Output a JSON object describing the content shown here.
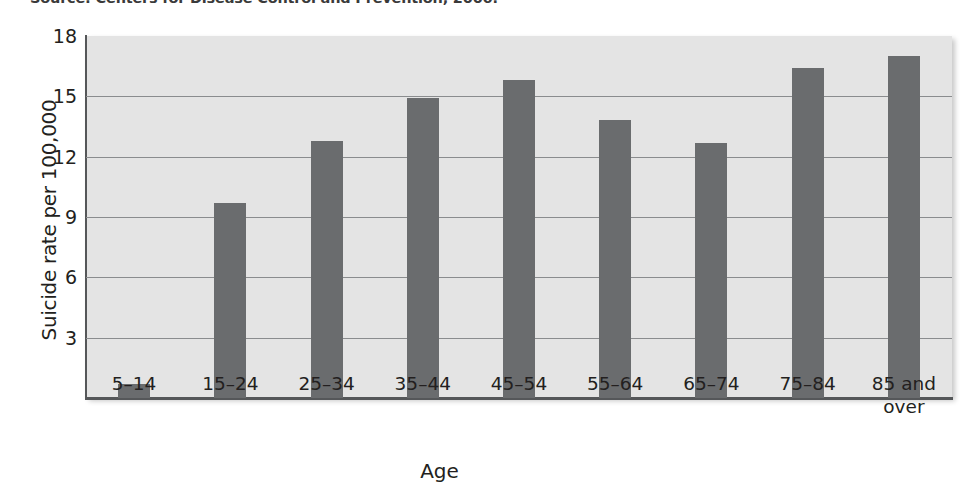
{
  "figure": {
    "source_note": "Source: Centers for Disease Control and Prevention, 2006."
  },
  "chart_data": {
    "type": "bar",
    "title": "",
    "subtitle": "",
    "xlabel": "Age",
    "ylabel": "Suicide rate per 100,000",
    "categories": [
      "5–14",
      "15–24",
      "25–34",
      "35–44",
      "45–54",
      "55–64",
      "65–74",
      "75–84",
      "85 and over"
    ],
    "values": [
      0.7,
      9.7,
      12.8,
      14.9,
      15.8,
      13.8,
      12.7,
      16.4,
      17.0
    ],
    "ylim": [
      0,
      18
    ],
    "yticks": [
      3,
      6,
      9,
      12,
      15,
      18
    ],
    "ytick_labels": [
      "3",
      "6",
      "9",
      "12",
      "15",
      "18"
    ],
    "grid": "horizontal",
    "legend": "none",
    "bar_color": "#6a6c6e",
    "plot_background": "#e4e4e4",
    "axis_color": "#555759",
    "gridline_color": "#8a8c8e"
  }
}
